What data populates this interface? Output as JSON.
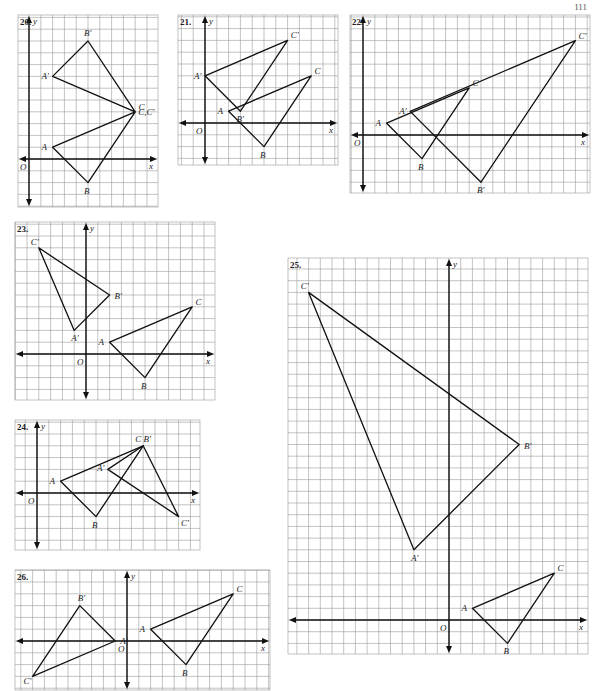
{
  "page": {
    "number": "111"
  },
  "style": {
    "grid_color": "#9a9a9a",
    "line_color": "#111111",
    "label_color": "#222222",
    "background": "#ffffff"
  },
  "graphs": [
    {
      "id": "20",
      "label": "20.",
      "box": {
        "left": 18,
        "top": 15,
        "width": 140,
        "height": 192
      },
      "origin": {
        "x": 29,
        "y": 159
      },
      "unit": 11.8,
      "triangles": [
        {
          "name": "ABC",
          "points": [
            {
              "label": "A",
              "x": 2,
              "y": 1
            },
            {
              "label": "B",
              "x": 5,
              "y": -2
            },
            {
              "label": "C",
              "x": 9,
              "y": 4
            }
          ]
        },
        {
          "name": "A'B'C'",
          "points": [
            {
              "label": "A′",
              "x": 2,
              "y": 7
            },
            {
              "label": "B′",
              "x": 5,
              "y": 10
            },
            {
              "label": "",
              "x": 9,
              "y": 4
            }
          ]
        }
      ],
      "extra_labels": [
        {
          "text": "C,C′",
          "x": 9,
          "y": 4,
          "dx": 3,
          "dy": 3
        }
      ]
    },
    {
      "id": "21",
      "label": "21.",
      "box": {
        "left": 178,
        "top": 15,
        "width": 160,
        "height": 150
      },
      "origin": {
        "x": 205,
        "y": 123
      },
      "unit": 11.8,
      "triangles": [
        {
          "name": "ABC",
          "points": [
            {
              "label": "A",
              "x": 2,
              "y": 1
            },
            {
              "label": "B",
              "x": 5,
              "y": -2
            },
            {
              "label": "C",
              "x": 9,
              "y": 4
            }
          ]
        },
        {
          "name": "A'B'C'",
          "points": [
            {
              "label": "A′",
              "x": 0,
              "y": 4
            },
            {
              "label": "B′",
              "x": 3,
              "y": 1
            },
            {
              "label": "C′",
              "x": 7,
              "y": 7
            }
          ]
        }
      ]
    },
    {
      "id": "22",
      "label": "22.",
      "box": {
        "left": 350,
        "top": 15,
        "width": 240,
        "height": 178
      },
      "origin": {
        "x": 363,
        "y": 135
      },
      "unit": 11.8,
      "triangles": [
        {
          "name": "ABC",
          "points": [
            {
              "label": "A",
              "x": 2,
              "y": 1
            },
            {
              "label": "B",
              "x": 5,
              "y": -2
            },
            {
              "label": "C",
              "x": 9,
              "y": 4
            }
          ]
        },
        {
          "name": "A'B'C'",
          "points": [
            {
              "label": "A′",
              "x": 4,
              "y": 2
            },
            {
              "label": "B′",
              "x": 10,
              "y": -4
            },
            {
              "label": "C′",
              "x": 18,
              "y": 8
            }
          ]
        }
      ]
    },
    {
      "id": "23",
      "label": "23.",
      "box": {
        "left": 15,
        "top": 222,
        "width": 200,
        "height": 178
      },
      "origin": {
        "x": 86,
        "y": 354
      },
      "unit": 11.8,
      "triangles": [
        {
          "name": "ABC",
          "points": [
            {
              "label": "A",
              "x": 2,
              "y": 1
            },
            {
              "label": "B",
              "x": 5,
              "y": -2
            },
            {
              "label": "C",
              "x": 9,
              "y": 4
            }
          ]
        },
        {
          "name": "A'B'C'",
          "points": [
            {
              "label": "A′",
              "x": -1,
              "y": 2
            },
            {
              "label": "B′",
              "x": 2,
              "y": 5
            },
            {
              "label": "C′",
              "x": -4,
              "y": 9
            }
          ]
        }
      ]
    },
    {
      "id": "24",
      "label": "24.",
      "box": {
        "left": 15,
        "top": 420,
        "width": 185,
        "height": 130
      },
      "origin": {
        "x": 37,
        "y": 493
      },
      "unit": 11.8,
      "triangles": [
        {
          "name": "ABC",
          "points": [
            {
              "label": "A",
              "x": 2,
              "y": 1
            },
            {
              "label": "B",
              "x": 5,
              "y": -2
            },
            {
              "label": "",
              "x": 9,
              "y": 4
            }
          ]
        },
        {
          "name": "A'B'C'",
          "points": [
            {
              "label": "A′",
              "x": 6,
              "y": 2
            },
            {
              "label": "",
              "x": 9,
              "y": 4
            },
            {
              "label": "C′",
              "x": 12,
              "y": -2
            }
          ]
        }
      ],
      "extra_labels": [
        {
          "text": "C  B′",
          "x": 9,
          "y": 4,
          "dx": -8,
          "dy": -4
        }
      ]
    },
    {
      "id": "25",
      "label": "25.",
      "box": {
        "left": 288,
        "top": 258,
        "width": 300,
        "height": 396
      },
      "origin": {
        "x": 449,
        "y": 620
      },
      "unit": 11.7,
      "triangles": [
        {
          "name": "ABC",
          "points": [
            {
              "label": "A",
              "x": 2,
              "y": 1
            },
            {
              "label": "B",
              "x": 5,
              "y": -2
            },
            {
              "label": "C",
              "x": 9,
              "y": 4
            }
          ]
        },
        {
          "name": "A'B'C'",
          "points": [
            {
              "label": "A′",
              "x": -3,
              "y": 6
            },
            {
              "label": "B′",
              "x": 6,
              "y": 15
            },
            {
              "label": "C′",
              "x": -12,
              "y": 28
            }
          ]
        }
      ]
    },
    {
      "id": "26",
      "label": "26.",
      "box": {
        "left": 15,
        "top": 570,
        "width": 255,
        "height": 120
      },
      "origin": {
        "x": 127,
        "y": 641
      },
      "unit": 11.8,
      "triangles": [
        {
          "name": "ABC",
          "points": [
            {
              "label": "A",
              "x": 2,
              "y": 1
            },
            {
              "label": "B",
              "x": 5,
              "y": -2
            },
            {
              "label": "C",
              "x": 9,
              "y": 4
            }
          ]
        },
        {
          "name": "A'B'C'",
          "points": [
            {
              "label": "A′",
              "x": -1,
              "y": 0
            },
            {
              "label": "B′",
              "x": -4,
              "y": 3
            },
            {
              "label": "C′",
              "x": -8,
              "y": -3
            }
          ]
        }
      ]
    }
  ],
  "axis_labels": {
    "x": "x",
    "y": "y",
    "origin": "O"
  }
}
